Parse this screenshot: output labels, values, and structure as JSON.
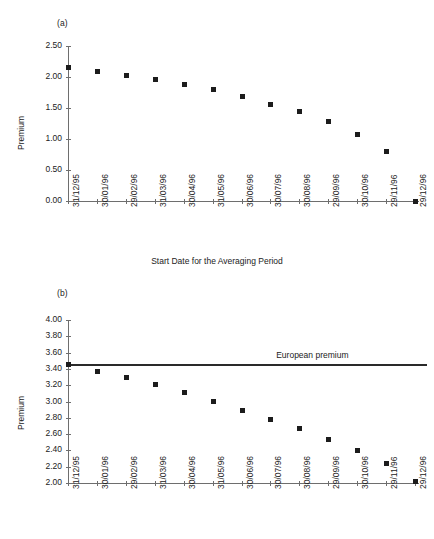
{
  "figure": {
    "panel_a_label": "(a)",
    "panel_b_label": "(b)"
  },
  "chart_data": [
    {
      "type": "scatter",
      "panel": "(a)",
      "title": "",
      "xlabel": "Start Date for the Averaging Period",
      "ylabel": "Premium",
      "ylim": [
        0.0,
        2.5
      ],
      "ytick_step": 0.5,
      "ytick_labels": [
        "0.00",
        "0.50",
        "1.00",
        "1.50",
        "2.00",
        "2.50"
      ],
      "ytick_values": [
        0.0,
        0.5,
        1.0,
        1.5,
        2.0,
        2.5
      ],
      "grid": false,
      "legend": "none",
      "categories": [
        "31/12/95",
        "30/01/96",
        "29/02/96",
        "31/03/96",
        "30/04/96",
        "31/05/96",
        "30/06/96",
        "30/07/96",
        "30/08/96",
        "29/09/96",
        "30/10/96",
        "29/11/96",
        "29/12/96"
      ],
      "values": [
        2.16,
        2.1,
        2.04,
        1.97,
        1.88,
        1.8,
        1.69,
        1.57,
        1.45,
        1.29,
        1.08,
        0.81,
        0.0
      ]
    },
    {
      "type": "scatter",
      "panel": "(b)",
      "title": "",
      "xlabel": "",
      "ylabel": "Premium",
      "ylim": [
        2.0,
        4.0
      ],
      "ytick_step": 0.2,
      "ytick_labels": [
        "2.00",
        "2.20",
        "2.40",
        "2.60",
        "2.80",
        "3.00",
        "3.20",
        "3.40",
        "3.60",
        "3.80",
        "4.00"
      ],
      "ytick_values": [
        2.0,
        2.2,
        2.4,
        2.6,
        2.8,
        3.0,
        3.2,
        3.4,
        3.6,
        3.8,
        4.0
      ],
      "grid": false,
      "legend": "none",
      "categories": [
        "31/12/95",
        "30/01/96",
        "29/02/96",
        "31/03/96",
        "30/04/96",
        "31/05/96",
        "30/06/96",
        "30/07/96",
        "30/08/96",
        "29/09/96",
        "30/10/96",
        "29/11/96",
        "29/12/96"
      ],
      "values": [
        3.46,
        3.38,
        3.3,
        3.21,
        3.12,
        3.01,
        2.9,
        2.79,
        2.67,
        2.54,
        2.4,
        2.24,
        2.03
      ],
      "annotations": [
        {
          "kind": "hline",
          "label": "European premium",
          "value": 3.46,
          "color": "#2a2a2a"
        }
      ]
    }
  ]
}
